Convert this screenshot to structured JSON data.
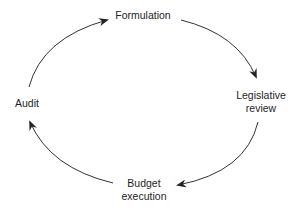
{
  "diagram": {
    "type": "cycle",
    "colors": {
      "background": "#ffffff",
      "arrow": "#333333",
      "text": "#1e1e1e"
    },
    "nodes": [
      {
        "id": "formulation",
        "lines": [
          "Formulation"
        ]
      },
      {
        "id": "legislative-review",
        "lines": [
          "Legislative",
          "review"
        ]
      },
      {
        "id": "budget-execution",
        "lines": [
          "Budget",
          "execution"
        ]
      },
      {
        "id": "audit",
        "lines": [
          "Audit"
        ]
      }
    ],
    "edges": [
      {
        "from": "formulation",
        "to": "legislative-review"
      },
      {
        "from": "legislative-review",
        "to": "budget-execution"
      },
      {
        "from": "budget-execution",
        "to": "audit"
      },
      {
        "from": "audit",
        "to": "formulation"
      }
    ]
  }
}
